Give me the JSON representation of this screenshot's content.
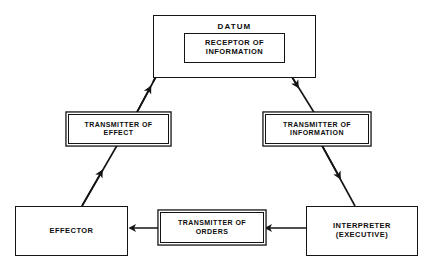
{
  "diagram": {
    "colors": {
      "background": "#ffffff",
      "stroke": "#141414",
      "text": "#0d0d0d"
    },
    "nodes": [
      {
        "id": "datum",
        "label": "DATUM",
        "shape": "rectangle"
      },
      {
        "id": "receptor",
        "label": "RECEPTOR OF\nINFORMATION",
        "shape": "rectangle",
        "nested_in": "datum"
      },
      {
        "id": "transmitter-effect",
        "label": "TRANSMITTER OF\nEFFECT",
        "shape": "rectangle-double"
      },
      {
        "id": "transmitter-information",
        "label": "TRANSMITTER OF\nINFORMATION",
        "shape": "rectangle-double"
      },
      {
        "id": "effector",
        "label": "EFFECTOR",
        "shape": "rectangle"
      },
      {
        "id": "transmitter-orders",
        "label": "TRANSMITTER OF\nORDERS",
        "shape": "rectangle-double"
      },
      {
        "id": "interpreter",
        "label": "INTERPRETER\n(EXECUTIVE)",
        "shape": "rectangle"
      }
    ],
    "edges": [
      {
        "id": "effector-to-transmitter-effect",
        "from": "effector",
        "to": "transmitter-effect",
        "direction": "up-right"
      },
      {
        "id": "transmitter-effect-to-receptor",
        "from": "transmitter-effect",
        "to": "receptor",
        "direction": "up-right"
      },
      {
        "id": "receptor-to-transmitter-information",
        "from": "receptor",
        "to": "transmitter-information",
        "direction": "down-right"
      },
      {
        "id": "transmitter-information-to-interpreter",
        "from": "transmitter-information",
        "to": "interpreter",
        "direction": "down-right"
      },
      {
        "id": "interpreter-to-transmitter-orders",
        "from": "interpreter",
        "to": "transmitter-orders",
        "direction": "left"
      },
      {
        "id": "transmitter-orders-to-effector",
        "from": "transmitter-orders",
        "to": "effector",
        "direction": "left"
      }
    ]
  }
}
